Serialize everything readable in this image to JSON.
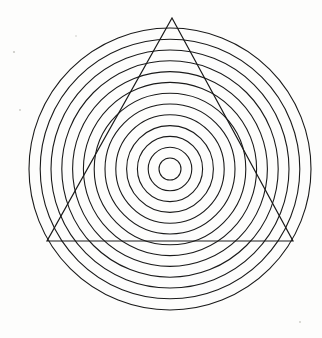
{
  "figure": {
    "background_color": "#fdfdfc",
    "stroke_color": "#1a1a1a",
    "canvas": {
      "width": 322,
      "height": 338
    }
  },
  "chart_data": {
    "type": "scatter",
    "subtitle": "",
    "xlabel": "",
    "ylabel": "",
    "grid": false,
    "legend": false,
    "xlim": [
      0,
      322
    ],
    "ylim": [
      0,
      338
    ],
    "center": {
      "x": 170,
      "y": 169
    },
    "circle_count": 13,
    "ring_spacing": 10.8,
    "radii": [
      11,
      21.8,
      32.6,
      43.4,
      54.2,
      65,
      75.8,
      86.6,
      97.4,
      108.2,
      119,
      129.8,
      141
    ],
    "triangle": {
      "sides": 3,
      "vertices": [
        {
          "x": 172,
          "y": 18
        },
        {
          "x": 293,
          "y": 241
        },
        {
          "x": 47,
          "y": 241
        }
      ],
      "edge_length": 246,
      "orientation": "apex-up"
    },
    "specks": [
      {
        "x": 14,
        "y": 52,
        "r": 1.1
      },
      {
        "x": 20,
        "y": 110,
        "r": 0.9
      },
      {
        "x": 76,
        "y": 36,
        "r": 0.8
      },
      {
        "x": 300,
        "y": 322,
        "r": 0.9
      }
    ]
  }
}
